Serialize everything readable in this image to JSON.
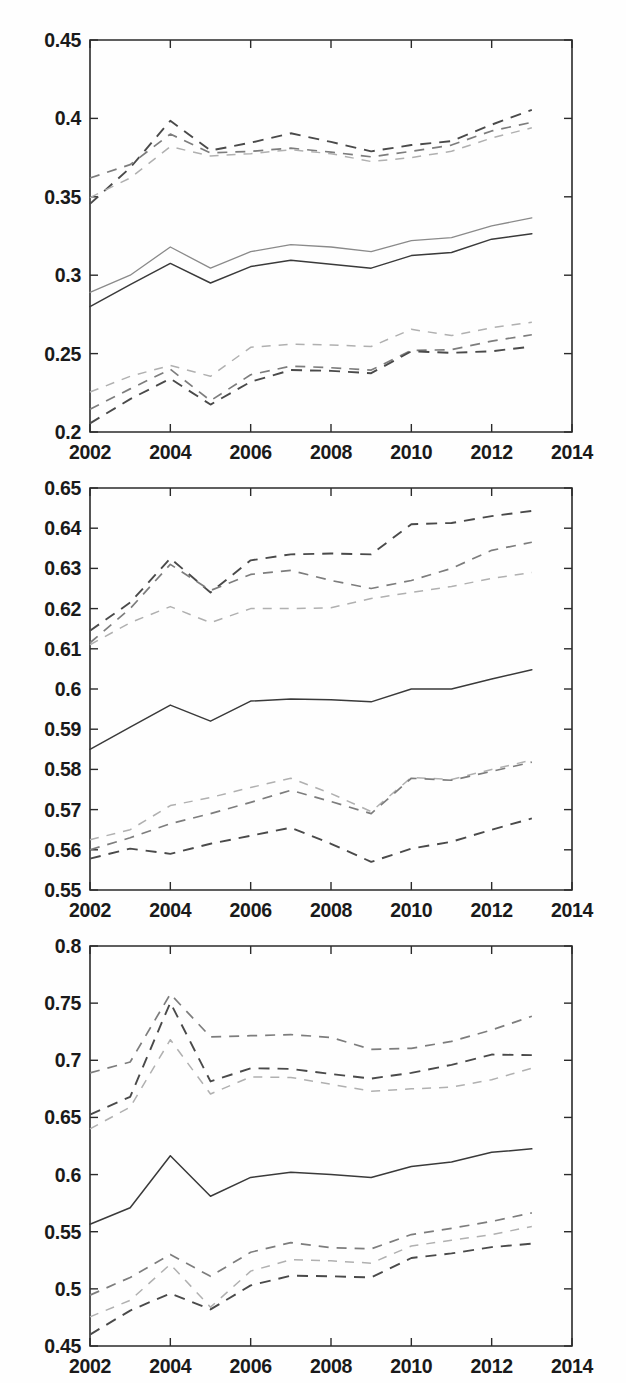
{
  "figure": {
    "title": "",
    "panel_count": 3,
    "width": 626,
    "height": 1383,
    "background": "#ffffff",
    "style": "matlab-scanned-monochrome"
  },
  "chart_data": [
    {
      "id": "panel-top",
      "type": "line",
      "title": "",
      "xlabel": "",
      "ylabel": "",
      "xlim": [
        2002,
        2014
      ],
      "ylim": [
        0.2,
        0.45
      ],
      "grid": false,
      "legend": "none",
      "x": [
        2002,
        2003,
        2004,
        2005,
        2006,
        2007,
        2008,
        2009,
        2010,
        2011,
        2012,
        2013
      ],
      "xticks": [
        2002,
        2004,
        2006,
        2008,
        2010,
        2012,
        2014
      ],
      "xticklabels": [
        "2002",
        "2004",
        "2006",
        "2008",
        "2010",
        "2012",
        "2014"
      ],
      "yticks": [
        0.2,
        0.25,
        0.3,
        0.35,
        0.4,
        0.45
      ],
      "yticklabels": [
        "0.2",
        "0.25",
        "0.3",
        "0.35",
        "0.4",
        "0.45"
      ],
      "series": [
        {
          "name": "upper-band-dark",
          "style": "dashed",
          "shade": "#4a4a4a",
          "values": [
            0.3455,
            0.3685,
            0.3985,
            0.3795,
            0.3845,
            0.3905,
            0.385,
            0.379,
            0.383,
            0.3855,
            0.396,
            0.4055
          ]
        },
        {
          "name": "upper-band-mid",
          "style": "dashed",
          "shade": "#7d7d7d",
          "values": [
            0.362,
            0.3705,
            0.39,
            0.378,
            0.379,
            0.381,
            0.3785,
            0.3755,
            0.379,
            0.383,
            0.392,
            0.3975
          ]
        },
        {
          "name": "upper-band-light",
          "style": "dashed",
          "shade": "#b0b0b0",
          "values": [
            0.3495,
            0.362,
            0.382,
            0.376,
            0.3775,
            0.38,
            0.3775,
            0.3725,
            0.375,
            0.379,
            0.3875,
            0.394
          ]
        },
        {
          "name": "central-light",
          "style": "solid",
          "shade": "#8a8a8a",
          "values": [
            0.289,
            0.3,
            0.318,
            0.3045,
            0.315,
            0.3195,
            0.318,
            0.315,
            0.322,
            0.324,
            0.3315,
            0.3365
          ]
        },
        {
          "name": "central-dark",
          "style": "solid",
          "shade": "#3a3a3a",
          "values": [
            0.28,
            0.294,
            0.3075,
            0.295,
            0.3055,
            0.3095,
            0.307,
            0.3045,
            0.3125,
            0.3145,
            0.323,
            0.3265
          ]
        },
        {
          "name": "lower-band-light",
          "style": "dashed",
          "shade": "#b0b0b0",
          "values": [
            0.2255,
            0.2355,
            0.2425,
            0.2355,
            0.254,
            0.256,
            0.2555,
            0.2545,
            0.2655,
            0.2615,
            0.2665,
            0.27
          ]
        },
        {
          "name": "lower-band-mid",
          "style": "dashed",
          "shade": "#7d7d7d",
          "values": [
            0.2145,
            0.2275,
            0.24,
            0.22,
            0.2365,
            0.242,
            0.241,
            0.2395,
            0.252,
            0.2525,
            0.258,
            0.262
          ]
        },
        {
          "name": "lower-band-dark",
          "style": "dashed",
          "shade": "#4a4a4a",
          "values": [
            0.2055,
            0.221,
            0.234,
            0.2175,
            0.232,
            0.2395,
            0.239,
            0.2375,
            0.2515,
            0.2505,
            0.2515,
            0.2545
          ]
        }
      ]
    },
    {
      "id": "panel-middle",
      "type": "line",
      "title": "",
      "xlabel": "",
      "ylabel": "",
      "xlim": [
        2002,
        2014
      ],
      "ylim": [
        0.55,
        0.65
      ],
      "grid": false,
      "legend": "none",
      "x": [
        2002,
        2003,
        2004,
        2005,
        2006,
        2007,
        2008,
        2009,
        2010,
        2011,
        2012,
        2013
      ],
      "xticks": [
        2002,
        2004,
        2006,
        2008,
        2010,
        2012,
        2014
      ],
      "xticklabels": [
        "2002",
        "2004",
        "2006",
        "2008",
        "2010",
        "2012",
        "2014"
      ],
      "yticks": [
        0.55,
        0.56,
        0.57,
        0.58,
        0.59,
        0.6,
        0.61,
        0.62,
        0.63,
        0.64,
        0.65
      ],
      "yticklabels": [
        "0.55",
        "0.56",
        "0.57",
        "0.58",
        "0.59",
        "0.6",
        "0.61",
        "0.62",
        "0.63",
        "0.64",
        "0.65"
      ],
      "series": [
        {
          "name": "upper-band-dark",
          "style": "dashed",
          "shade": "#4a4a4a",
          "values": [
            0.6145,
            0.6215,
            0.6325,
            0.624,
            0.632,
            0.6335,
            0.6337,
            0.6335,
            0.641,
            0.6413,
            0.643,
            0.6443
          ]
        },
        {
          "name": "upper-band-mid",
          "style": "dashed",
          "shade": "#7d7d7d",
          "values": [
            0.6115,
            0.62,
            0.631,
            0.6245,
            0.6285,
            0.6295,
            0.627,
            0.625,
            0.627,
            0.63,
            0.6345,
            0.6365
          ]
        },
        {
          "name": "upper-band-light",
          "style": "dashed",
          "shade": "#b0b0b0",
          "values": [
            0.611,
            0.6165,
            0.6205,
            0.6165,
            0.62,
            0.62,
            0.6202,
            0.6225,
            0.624,
            0.6255,
            0.6275,
            0.629
          ]
        },
        {
          "name": "central-dark",
          "style": "solid",
          "shade": "#3a3a3a",
          "values": [
            0.585,
            0.5905,
            0.596,
            0.592,
            0.597,
            0.5975,
            0.5973,
            0.5968,
            0.6,
            0.6,
            0.6025,
            0.6048
          ]
        },
        {
          "name": "lower-band-light",
          "style": "dashed",
          "shade": "#b0b0b0",
          "values": [
            0.5625,
            0.565,
            0.571,
            0.573,
            0.5755,
            0.5778,
            0.574,
            0.5695,
            0.578,
            0.5775,
            0.58,
            0.5823
          ]
        },
        {
          "name": "lower-band-mid",
          "style": "dashed",
          "shade": "#7d7d7d",
          "values": [
            0.56,
            0.563,
            0.5665,
            0.569,
            0.5718,
            0.5748,
            0.572,
            0.569,
            0.5778,
            0.5773,
            0.5795,
            0.5818
          ]
        },
        {
          "name": "lower-band-dark",
          "style": "dashed",
          "shade": "#4a4a4a",
          "values": [
            0.5578,
            0.5603,
            0.559,
            0.5615,
            0.5635,
            0.5655,
            0.5615,
            0.557,
            0.5603,
            0.562,
            0.565,
            0.5678
          ]
        }
      ]
    },
    {
      "id": "panel-bottom",
      "type": "line",
      "title": "",
      "xlabel": "",
      "ylabel": "",
      "xlim": [
        2002,
        2014
      ],
      "ylim": [
        0.45,
        0.8
      ],
      "grid": false,
      "legend": "none",
      "x": [
        2002,
        2003,
        2004,
        2005,
        2006,
        2007,
        2008,
        2009,
        2010,
        2011,
        2012,
        2013
      ],
      "xticks": [
        2002,
        2004,
        2006,
        2008,
        2010,
        2012,
        2014
      ],
      "xticklabels": [
        "2002",
        "2004",
        "2006",
        "2008",
        "2010",
        "2012",
        "2014"
      ],
      "yticks": [
        0.45,
        0.5,
        0.55,
        0.6,
        0.65,
        0.7,
        0.75,
        0.8
      ],
      "yticklabels": [
        "0.45",
        "0.5",
        "0.55",
        "0.6",
        "0.65",
        "0.7",
        "0.75",
        "0.8"
      ],
      "series": [
        {
          "name": "upper-band-mid",
          "style": "dashed",
          "shade": "#7d7d7d",
          "values": [
            0.689,
            0.6985,
            0.758,
            0.7205,
            0.7215,
            0.7225,
            0.72,
            0.7095,
            0.7105,
            0.7165,
            0.7265,
            0.7385
          ]
        },
        {
          "name": "upper-band-dark",
          "style": "dashed",
          "shade": "#4a4a4a",
          "values": [
            0.6525,
            0.668,
            0.7505,
            0.6815,
            0.693,
            0.6925,
            0.688,
            0.684,
            0.689,
            0.696,
            0.705,
            0.7045
          ]
        },
        {
          "name": "upper-band-light",
          "style": "dashed",
          "shade": "#b0b0b0",
          "values": [
            0.64,
            0.659,
            0.718,
            0.6705,
            0.6855,
            0.685,
            0.679,
            0.673,
            0.675,
            0.6765,
            0.683,
            0.693
          ]
        },
        {
          "name": "central-dark",
          "style": "solid",
          "shade": "#3a3a3a",
          "values": [
            0.5565,
            0.571,
            0.6165,
            0.581,
            0.5975,
            0.602,
            0.6,
            0.5975,
            0.607,
            0.611,
            0.6195,
            0.6225
          ]
        },
        {
          "name": "lower-band-mid",
          "style": "dashed",
          "shade": "#7d7d7d",
          "values": [
            0.4945,
            0.51,
            0.53,
            0.511,
            0.532,
            0.5405,
            0.536,
            0.535,
            0.5475,
            0.553,
            0.559,
            0.5665
          ]
        },
        {
          "name": "lower-band-light",
          "style": "dashed",
          "shade": "#b0b0b0",
          "values": [
            0.4755,
            0.49,
            0.5215,
            0.484,
            0.5155,
            0.5255,
            0.5245,
            0.5225,
            0.5375,
            0.5425,
            0.5475,
            0.5545
          ]
        },
        {
          "name": "lower-band-dark",
          "style": "dashed",
          "shade": "#4a4a4a",
          "values": [
            0.46,
            0.481,
            0.496,
            0.482,
            0.503,
            0.5115,
            0.511,
            0.51,
            0.527,
            0.531,
            0.5365,
            0.5395
          ]
        }
      ]
    }
  ]
}
